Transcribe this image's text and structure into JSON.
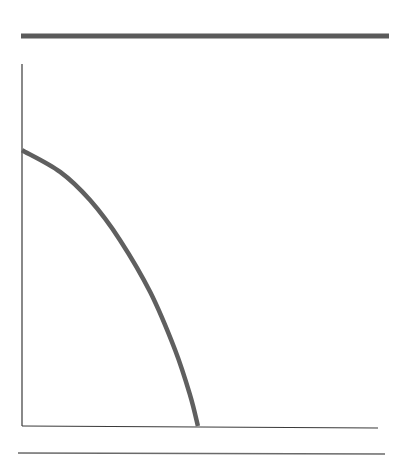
{
  "colors": {
    "background": "#ffffff",
    "top_rule": "#5a5a5a",
    "axis": "#3a3a3a",
    "curve": "#5f5f5f",
    "bottom_rule": "#6a6a6a"
  },
  "chart_data": {
    "type": "line",
    "title": "",
    "xlabel": "",
    "ylabel": "",
    "xlim": [
      0,
      100
    ],
    "ylim": [
      0,
      100
    ],
    "grid": false,
    "legend": null,
    "series": [
      {
        "name": "concave frontier curve",
        "x": [
          0,
          10.7,
          19.1,
          27.5,
          36.0,
          43.0,
          47.2,
          49.4
        ],
        "y": [
          76.2,
          70.2,
          62.4,
          51.4,
          37.0,
          21.0,
          8.6,
          0
        ]
      }
    ]
  }
}
